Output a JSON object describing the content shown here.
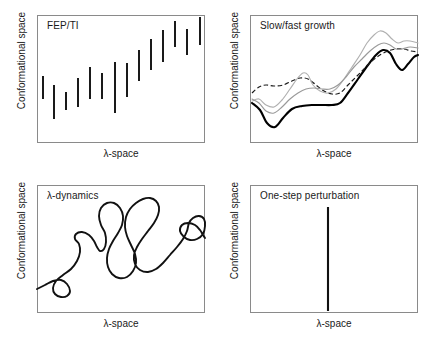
{
  "figure": {
    "axis_labels": {
      "x": "λ-space",
      "y": "Conformational space"
    },
    "frame_color": "#8a8a8a",
    "ink_color": "#1a1a1a"
  },
  "panels": {
    "fep_ti": {
      "title": "FEP/TI",
      "x_label": "λ-space",
      "y_label": "Conformational space"
    },
    "growth": {
      "title": "Slow/fast growth",
      "x_label": "λ-space",
      "y_label": "Conformational space"
    },
    "lambda_dynamics": {
      "title": "λ-dynamics",
      "x_label": "λ-space",
      "y_label": "Conformational space"
    },
    "one_step": {
      "title": "One-step perturbation",
      "x_label": "λ-space",
      "y_label": "Conformational space"
    }
  },
  "chart_data": [
    {
      "type": "bar",
      "panel": "fep_ti",
      "title": "FEP/TI",
      "xlabel": "λ-space",
      "ylabel": "Conformational space",
      "xlim": [
        0,
        168
      ],
      "ylim": [
        0,
        128
      ],
      "grid": false,
      "legend": "none",
      "description": "Fourteen disconnected vertical line segments, each representing an independent lambda window sampling a narrow band of conformational space; the bands drift upward from left to right.",
      "segments": [
        {
          "x": 6,
          "y_bottom": 84,
          "y_top": 61
        },
        {
          "x": 17,
          "y_bottom": 104,
          "y_top": 70
        },
        {
          "x": 29,
          "y_bottom": 95,
          "y_top": 77
        },
        {
          "x": 41,
          "y_bottom": 92,
          "y_top": 63
        },
        {
          "x": 53,
          "y_bottom": 84,
          "y_top": 52
        },
        {
          "x": 65,
          "y_bottom": 84,
          "y_top": 58
        },
        {
          "x": 78,
          "y_bottom": 98,
          "y_top": 47
        },
        {
          "x": 90,
          "y_bottom": 82,
          "y_top": 48
        },
        {
          "x": 102,
          "y_bottom": 66,
          "y_top": 35
        },
        {
          "x": 114,
          "y_bottom": 55,
          "y_top": 24
        },
        {
          "x": 126,
          "y_bottom": 47,
          "y_top": 15
        },
        {
          "x": 138,
          "y_bottom": 32,
          "y_top": 6
        },
        {
          "x": 150,
          "y_bottom": 40,
          "y_top": 14
        },
        {
          "x": 163,
          "y_bottom": 30,
          "y_top": 2
        }
      ]
    },
    {
      "type": "line",
      "panel": "growth",
      "title": "Slow/fast growth",
      "xlabel": "λ-space",
      "ylabel": "Conformational space",
      "xlim": [
        0,
        168
      ],
      "ylim": [
        0,
        128
      ],
      "grid": false,
      "legend": "none",
      "description": "Four continuous trajectories traversing lambda space at different growth rates; one thick solid black curve, one dashed curve and two thin gray curves that diverge mid-range and converge at the upper right.",
      "series": [
        {
          "name": "thick-solid",
          "style": "solid-thick",
          "color": "#000000",
          "points": [
            [
              2,
              88
            ],
            [
              10,
              95
            ],
            [
              17,
              108
            ],
            [
              25,
              112
            ],
            [
              33,
              103
            ],
            [
              42,
              94
            ],
            [
              52,
              91
            ],
            [
              62,
              90
            ],
            [
              72,
              90
            ],
            [
              82,
              90
            ],
            [
              90,
              88
            ],
            [
              98,
              78
            ],
            [
              108,
              64
            ],
            [
              118,
              50
            ],
            [
              126,
              40
            ],
            [
              133,
              35
            ],
            [
              140,
              38
            ],
            [
              146,
              49
            ],
            [
              152,
              55
            ],
            [
              158,
              49
            ],
            [
              164,
              42
            ],
            [
              168,
              40
            ]
          ]
        },
        {
          "name": "dashed",
          "style": "dashed",
          "color": "#1a1a1a",
          "points": [
            [
              2,
              78
            ],
            [
              9,
              72
            ],
            [
              16,
              70
            ],
            [
              24,
              71
            ],
            [
              33,
              70
            ],
            [
              42,
              66
            ],
            [
              50,
              63
            ],
            [
              58,
              64
            ],
            [
              66,
              70
            ],
            [
              74,
              76
            ],
            [
              82,
              79
            ],
            [
              90,
              78
            ],
            [
              98,
              70
            ],
            [
              106,
              62
            ],
            [
              114,
              54
            ],
            [
              122,
              46
            ],
            [
              130,
              40
            ],
            [
              138,
              36
            ],
            [
              146,
              34
            ],
            [
              154,
              34
            ],
            [
              161,
              36
            ],
            [
              168,
              37
            ]
          ]
        },
        {
          "name": "gray-fast",
          "style": "gray",
          "color": "#b0b0b0",
          "points": [
            [
              2,
              86
            ],
            [
              9,
              84
            ],
            [
              16,
              90
            ],
            [
              24,
              92
            ],
            [
              32,
              85
            ],
            [
              40,
              74
            ],
            [
              47,
              64
            ],
            [
              53,
              58
            ],
            [
              58,
              60
            ],
            [
              63,
              70
            ],
            [
              70,
              76
            ],
            [
              78,
              78
            ],
            [
              86,
              74
            ],
            [
              94,
              64
            ],
            [
              102,
              52
            ],
            [
              110,
              40
            ],
            [
              117,
              28
            ],
            [
              124,
              20
            ],
            [
              130,
              16
            ],
            [
              136,
              18
            ],
            [
              142,
              24
            ],
            [
              148,
              28
            ],
            [
              154,
              26
            ],
            [
              160,
              26
            ],
            [
              168,
              28
            ]
          ]
        },
        {
          "name": "gray-slow",
          "style": "gray2",
          "color": "#9a9a9a",
          "points": [
            [
              2,
              84
            ],
            [
              9,
              88
            ],
            [
              16,
              96
            ],
            [
              24,
              98
            ],
            [
              32,
              92
            ],
            [
              40,
              84
            ],
            [
              48,
              78
            ],
            [
              56,
              74
            ],
            [
              64,
              73
            ],
            [
              72,
              74
            ],
            [
              80,
              74
            ],
            [
              88,
              70
            ],
            [
              96,
              62
            ],
            [
              104,
              52
            ],
            [
              112,
              44
            ],
            [
              120,
              36
            ],
            [
              128,
              30
            ],
            [
              134,
              28
            ],
            [
              140,
              30
            ],
            [
              146,
              34
            ],
            [
              152,
              34
            ],
            [
              160,
              32
            ],
            [
              168,
              33
            ]
          ]
        }
      ]
    },
    {
      "type": "line",
      "panel": "lambda_dynamics",
      "title": "λ-dynamics",
      "xlabel": "λ-space",
      "ylabel": "Conformational space",
      "xlim": [
        0,
        168
      ],
      "ylim": [
        0,
        128
      ],
      "grid": false,
      "legend": "none",
      "description": "A single continuous self-crossing random-walk trajectory that wanders freely through both lambda space and conformational space, entering at the lower left and ending at the right edge.",
      "series": [
        {
          "name": "random-walk",
          "style": "solid",
          "color": "#111111",
          "points": [
            [
              0,
              104
            ],
            [
              8,
              100
            ],
            [
              16,
              96
            ],
            [
              24,
              95
            ],
            [
              30,
              99
            ],
            [
              33,
              106
            ],
            [
              30,
              111
            ],
            [
              24,
              112
            ],
            [
              18,
              109
            ],
            [
              16,
              103
            ],
            [
              19,
              96
            ],
            [
              26,
              90
            ],
            [
              34,
              84
            ],
            [
              40,
              76
            ],
            [
              43,
              67
            ],
            [
              42,
              59
            ],
            [
              38,
              54
            ],
            [
              39,
              49
            ],
            [
              45,
              47
            ],
            [
              52,
              50
            ],
            [
              57,
              56
            ],
            [
              60,
              62
            ],
            [
              63,
              66
            ],
            [
              67,
              64
            ],
            [
              69,
              57
            ],
            [
              68,
              48
            ],
            [
              64,
              40
            ],
            [
              62,
              31
            ],
            [
              64,
              23
            ],
            [
              70,
              18
            ],
            [
              77,
              18
            ],
            [
              83,
              23
            ],
            [
              86,
              31
            ],
            [
              85,
              40
            ],
            [
              81,
              48
            ],
            [
              76,
              56
            ],
            [
              72,
              64
            ],
            [
              70,
              73
            ],
            [
              71,
              82
            ],
            [
              75,
              89
            ],
            [
              82,
              93
            ],
            [
              90,
              92
            ],
            [
              96,
              86
            ],
            [
              99,
              78
            ],
            [
              98,
              69
            ],
            [
              94,
              60
            ],
            [
              90,
              51
            ],
            [
              88,
              42
            ],
            [
              89,
              32
            ],
            [
              93,
              24
            ],
            [
              99,
              18
            ],
            [
              106,
              14
            ],
            [
              113,
              13
            ],
            [
              119,
              16
            ],
            [
              122,
              22
            ],
            [
              121,
              30
            ],
            [
              117,
              38
            ],
            [
              111,
              46
            ],
            [
              105,
              54
            ],
            [
              100,
              62
            ],
            [
              97,
              70
            ],
            [
              98,
              79
            ],
            [
              103,
              85
            ],
            [
              111,
              87
            ],
            [
              119,
              84
            ],
            [
              126,
              78
            ],
            [
              133,
              70
            ],
            [
              140,
              62
            ],
            [
              146,
              54
            ],
            [
              150,
              46
            ],
            [
              152,
              38
            ],
            [
              156,
              33
            ],
            [
              162,
              31
            ],
            [
              167,
              34
            ],
            [
              168,
              41
            ],
            [
              166,
              49
            ],
            [
              160,
              54
            ],
            [
              153,
              55
            ],
            [
              147,
              52
            ],
            [
              143,
              46
            ],
            [
              145,
              40
            ],
            [
              151,
              38
            ],
            [
              158,
              40
            ],
            [
              163,
              45
            ],
            [
              166,
              50
            ],
            [
              168,
              53
            ]
          ]
        }
      ]
    },
    {
      "type": "bar",
      "panel": "one_step",
      "title": "One-step perturbation",
      "xlabel": "λ-space",
      "ylabel": "Conformational space",
      "xlim": [
        0,
        168
      ],
      "ylim": [
        0,
        128
      ],
      "grid": false,
      "legend": "none",
      "description": "A single tall vertical line at one fixed lambda value, spanning a wide range of conformational space, representing exhaustive sampling of a single reference state.",
      "segments": [
        {
          "x": 78,
          "y_bottom": 126,
          "y_top": 22
        }
      ]
    }
  ]
}
